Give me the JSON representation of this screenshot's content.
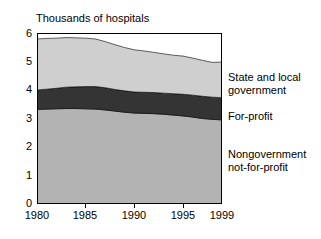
{
  "chart": {
    "axis_title": "Thousands of hospitals",
    "y_ticks": [
      "0",
      "1",
      "2",
      "3",
      "4",
      "5",
      "6"
    ],
    "x_ticks": [
      "1980",
      "1985",
      "1990",
      "1995",
      "1999"
    ],
    "legend": {
      "series1": "State and local government",
      "series1_line1": "State and local",
      "series1_line2": "government",
      "series2": "For-profit",
      "series3": "Nongovernment not-for-profit",
      "series3_line1": "Nongovernment",
      "series3_line2": "not-for-profit"
    },
    "colors": {
      "state_local": "#cfcfcf",
      "for_profit": "#343434",
      "nongovernment": "#b3b3b3",
      "axis": "#000000",
      "background": "#ffffff"
    }
  },
  "chart_data": {
    "type": "area",
    "title": "Thousands of hospitals",
    "xlabel": "",
    "ylabel": "Thousands of hospitals",
    "xlim": [
      1980,
      1999
    ],
    "ylim": [
      0,
      6
    ],
    "grid": false,
    "legend_position": "right",
    "stacked": true,
    "x": [
      1980,
      1981,
      1982,
      1983,
      1984,
      1985,
      1986,
      1987,
      1988,
      1989,
      1990,
      1991,
      1992,
      1993,
      1994,
      1995,
      1996,
      1997,
      1998,
      1999
    ],
    "series": [
      {
        "name": "Nongovernment not-for-profit",
        "color": "#b3b3b3",
        "values": [
          3.32,
          3.33,
          3.34,
          3.35,
          3.35,
          3.34,
          3.33,
          3.3,
          3.26,
          3.22,
          3.19,
          3.18,
          3.17,
          3.15,
          3.12,
          3.09,
          3.05,
          3.0,
          2.97,
          2.95
        ]
      },
      {
        "name": "For-profit",
        "color": "#343434",
        "values": [
          0.68,
          0.7,
          0.72,
          0.75,
          0.76,
          0.78,
          0.79,
          0.78,
          0.76,
          0.75,
          0.74,
          0.74,
          0.74,
          0.74,
          0.75,
          0.76,
          0.77,
          0.78,
          0.78,
          0.78
        ]
      },
      {
        "name": "State and local government",
        "color": "#cfcfcf",
        "values": [
          1.79,
          1.78,
          1.76,
          1.74,
          1.72,
          1.7,
          1.67,
          1.62,
          1.57,
          1.52,
          1.48,
          1.45,
          1.41,
          1.38,
          1.35,
          1.34,
          1.3,
          1.26,
          1.22,
          1.25
        ]
      }
    ],
    "cumulative_totals": [
      5.79,
      5.81,
      5.82,
      5.84,
      5.83,
      5.82,
      5.79,
      5.7,
      5.59,
      5.49,
      5.41,
      5.37,
      5.32,
      5.27,
      5.22,
      5.19,
      5.12,
      5.04,
      4.97,
      4.98
    ]
  }
}
